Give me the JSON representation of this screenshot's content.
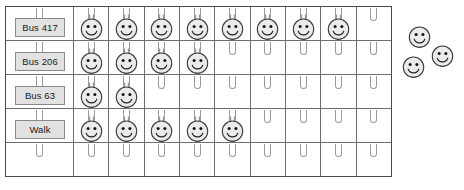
{
  "chart_data": {
    "type": "bar",
    "title": "",
    "xlabel": "",
    "ylabel": "",
    "orientation": "horizontal",
    "unit": "smiley token",
    "columns": 9,
    "categories": [
      "Bus 417",
      "Bus 206",
      "Bus 63",
      "Walk"
    ],
    "values": [
      8,
      4,
      2,
      5
    ],
    "unplaced_tokens": 3,
    "grid": true,
    "legend": "none"
  },
  "board": {
    "rows": [
      {
        "label": "Bus 417",
        "count": 8,
        "has_label": true
      },
      {
        "label": "Bus 206",
        "count": 4,
        "has_label": true
      },
      {
        "label": "Bus 63",
        "count": 2,
        "has_label": true
      },
      {
        "label": "Walk",
        "count": 5,
        "has_label": true
      },
      {
        "label": "",
        "count": 0,
        "has_label": false
      }
    ],
    "data_columns": 9
  },
  "loose_tokens": {
    "count": 3,
    "items": [
      {
        "x": 8,
        "y": 0
      },
      {
        "x": 31,
        "y": 19
      },
      {
        "x": 2,
        "y": 30
      }
    ]
  },
  "colors": {
    "board_border": "#4a4a4a",
    "grid_line": "#6f6f6f",
    "hook": "#9a9a9a",
    "label_fill": "#e2e2e2",
    "label_border": "#8a8a8a",
    "token_fill": "#ebebeb",
    "token_stroke": "#3c3c3c",
    "background": "#ffffff"
  },
  "icons": {
    "token": "smiley-face-icon",
    "hook": "hook-icon"
  }
}
